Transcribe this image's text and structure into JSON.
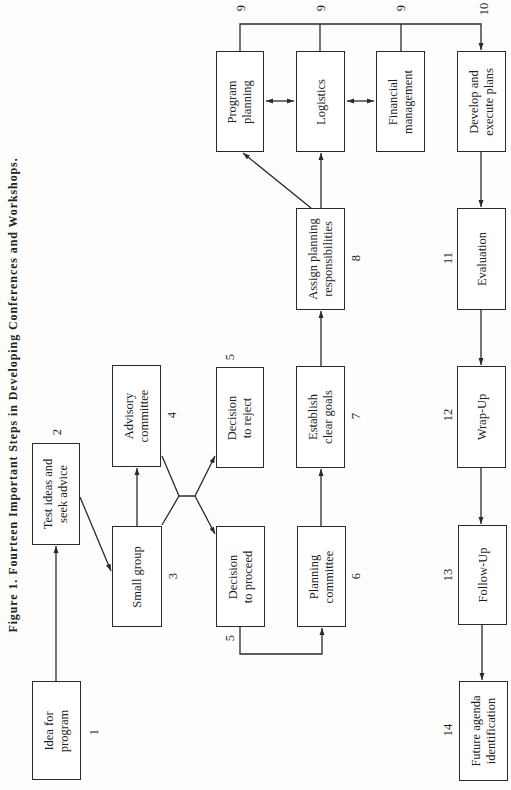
{
  "figure": {
    "caption": "Figure 1. Fourteen Important Steps in Developing Conferences and Workshops.",
    "orientation": "rotated 90° counter-clockwise",
    "line_color": "#2a2a2a"
  },
  "steps": [
    {
      "id": "idea",
      "number": "1",
      "label": "Idea for\nprogram"
    },
    {
      "id": "test",
      "number": "2",
      "label": "Test ideas and\nseek advice"
    },
    {
      "id": "small",
      "number": "3",
      "label": "Small group"
    },
    {
      "id": "advisory",
      "number": "4",
      "label": "Advisory\ncommittee"
    },
    {
      "id": "proceed",
      "number": "5",
      "label": "Decision\nto proceed"
    },
    {
      "id": "reject",
      "number": "5",
      "label": "Decision\nto reject"
    },
    {
      "id": "planning_committee",
      "number": "6",
      "label": "Planning\ncommittee"
    },
    {
      "id": "goals",
      "number": "7",
      "label": "Establish\nclear goals"
    },
    {
      "id": "assign",
      "number": "8",
      "label": "Assign planning\nresponsibilities"
    },
    {
      "id": "program_planning",
      "number": "9",
      "label": "Program\nplanning"
    },
    {
      "id": "logistics",
      "number": "9",
      "label": "Logistics"
    },
    {
      "id": "financial",
      "number": "9",
      "label": "Financial\nmanagement"
    },
    {
      "id": "develop",
      "number": "10",
      "label": "Develop and\nexecute plans"
    },
    {
      "id": "evaluation",
      "number": "11",
      "label": "Evaluation"
    },
    {
      "id": "wrapup",
      "number": "12",
      "label": "Wrap-Up"
    },
    {
      "id": "followup",
      "number": "13",
      "label": "Follow-Up"
    },
    {
      "id": "future",
      "number": "14",
      "label": "Future agenda\nidentification"
    }
  ],
  "connections": [
    {
      "from": "1",
      "to": "2"
    },
    {
      "from": "2",
      "to": "3"
    },
    {
      "from": "3",
      "to": "4"
    },
    {
      "from": "3/4",
      "to": "5 (proceed)"
    },
    {
      "from": "3/4",
      "to": "5 (reject)"
    },
    {
      "from": "5 (proceed)",
      "to": "6"
    },
    {
      "from": "6",
      "to": "7"
    },
    {
      "from": "7",
      "to": "8"
    },
    {
      "from": "8",
      "to": "9 (Program planning)"
    },
    {
      "from": "8",
      "to": "9 (Logistics)"
    },
    {
      "from": "9 (Program planning)",
      "to": "9 (Logistics)",
      "bidirectional": true
    },
    {
      "from": "9 (Logistics)",
      "to": "9 (Financial management)",
      "bidirectional": true
    },
    {
      "from": "9 (all)",
      "to": "10"
    },
    {
      "from": "10",
      "to": "11"
    },
    {
      "from": "11",
      "to": "12"
    },
    {
      "from": "12",
      "to": "13"
    },
    {
      "from": "13",
      "to": "14"
    }
  ]
}
